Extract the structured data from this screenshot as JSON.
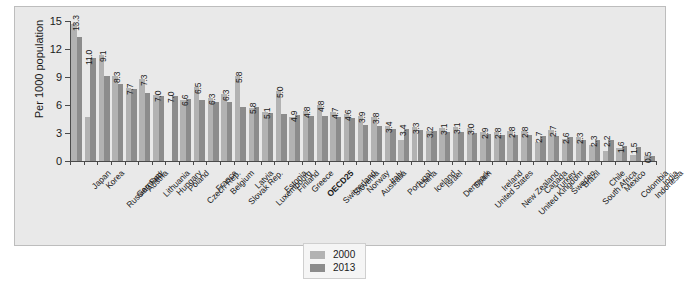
{
  "chart_data": {
    "type": "bar",
    "title": "",
    "xlabel": "",
    "ylabel": "Per 1000 population",
    "ylim": [
      0,
      15
    ],
    "yticks": [
      0,
      3,
      6,
      9,
      12,
      15
    ],
    "grid": false,
    "legend_position": "bottom-center",
    "highlight_category": "OECD25",
    "colors": {
      "2000": "#b2b2b2",
      "2013": "#8c8c8c"
    },
    "categories": [
      "Japan",
      "Korea",
      "Russian Fed.",
      "Germany",
      "Austria",
      "Lithuania",
      "Hungary",
      "Poland",
      "Czech Rep.",
      "France",
      "Belgium",
      "Slovak Rep.",
      "Latvia",
      "Luxembourg",
      "Estonia",
      "Finland",
      "Greece",
      "OECD25",
      "Switzerland",
      "Slovenia",
      "Norway",
      "Australia",
      "Italy",
      "Portugal",
      "China",
      "Iceland",
      "Israel",
      "Denmark",
      "Spain",
      "United States",
      "Ireland",
      "New Zealand",
      "United Kingdom",
      "Canada",
      "Turkey",
      "Sweden",
      "Brazil",
      "South Africa",
      "Chile",
      "Mexico",
      "Colombia",
      "Indonesia",
      "India"
    ],
    "series": [
      {
        "name": "2000",
        "values": [
          14.7,
          4.7,
          11.4,
          9.1,
          7.8,
          8.8,
          7.1,
          null,
          6.5,
          7.9,
          6.7,
          7.2,
          9.1,
          5.7,
          5.3,
          7.5,
          4.7,
          5.4,
          6.0,
          5.2,
          5.0,
          4.8,
          4.7,
          3.7,
          2.2,
          3.6,
          3.2,
          3.5,
          3.6,
          3.5,
          3.1,
          3.1,
          3.2,
          3.2,
          2.0,
          3.3,
          2.4,
          2.6,
          1.7,
          1.1,
          1.4,
          0.6,
          0.5
        ],
        "color": "#b2b2b2"
      },
      {
        "name": "2013",
        "values": [
          13.3,
          11.0,
          9.1,
          8.3,
          7.7,
          7.3,
          7.0,
          7.0,
          6.6,
          6.5,
          6.3,
          6.3,
          5.8,
          5.8,
          5.1,
          5.0,
          4.9,
          4.8,
          4.8,
          4.7,
          4.6,
          3.9,
          3.8,
          3.4,
          3.4,
          3.3,
          3.2,
          3.1,
          3.1,
          3.0,
          2.9,
          2.8,
          2.8,
          2.8,
          2.7,
          2.7,
          2.6,
          2.3,
          2.3,
          2.2,
          1.6,
          1.5,
          0.5
        ],
        "color": "#8c8c8c"
      }
    ],
    "value_labels": [
      "13.3",
      "11.0",
      "9.1",
      "8.3",
      "7.7",
      "7.3",
      "7.0",
      "7.0",
      "6.6",
      "6.5",
      "6.3",
      "6.3",
      "5.8",
      "5.8",
      "5.1",
      "5.0",
      "4.9",
      "4.8",
      "4.8",
      "4.7",
      "4.6",
      "3.9",
      "3.8",
      "3.4",
      "3.4",
      "3.3",
      "3.2",
      "3.1",
      "3.1",
      "3.0",
      "2.9",
      "2.8",
      "2.8",
      "2.8",
      "2.7",
      "2.7",
      "2.6",
      "2.3",
      "2.3",
      "2.2",
      "1.6",
      "1.5",
      "0.5"
    ]
  },
  "legend": {
    "entries": [
      {
        "label": "2000"
      },
      {
        "label": "2013"
      }
    ]
  },
  "axis": {
    "y_title": "Per 1000 population"
  }
}
